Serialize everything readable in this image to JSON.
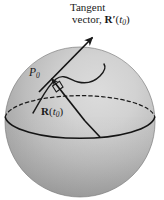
{
  "figure": {
    "width": 164,
    "height": 200,
    "background_color": "#ffffff"
  },
  "labels": {
    "tangent_line1": "Tangent",
    "tangent_line2_prefix": "vector, ",
    "tangent_vector_symbol": "R",
    "tangent_prime": "′",
    "tangent_arg_open": "(",
    "tangent_arg_var": "t",
    "tangent_arg_sub": "0",
    "tangent_arg_close": ")",
    "point_label_main": "P",
    "point_label_sub": "0",
    "position_vector_symbol": "R",
    "position_arg_open": "(",
    "position_arg_var": "t",
    "position_arg_sub": "0",
    "position_arg_close": ")"
  },
  "colors": {
    "sphere_highlight": "#d6d6d6",
    "sphere_mid": "#b8b8b8",
    "sphere_shadow": "#949494",
    "outline": "#1a1a1a",
    "text": "#1a1a1a",
    "background": "#ffffff"
  },
  "geometry": {
    "sphere_center_x": 80,
    "sphere_center_y": 122,
    "sphere_radius": 75,
    "equator_semi_major": 75,
    "equator_semi_minor": 23,
    "equator_center_y": 117,
    "point_p0_x": 50,
    "point_p0_y": 78,
    "tangent_arrow_tip_x": 93,
    "tangent_arrow_tip_y": 36,
    "position_vector_start_x": 84,
    "position_vector_start_y": 120
  },
  "elements": {
    "sphere_name": "sphere",
    "equator_back_name": "equator-back-dashed",
    "equator_front_name": "equator-front-solid",
    "curve_name": "surface-curve",
    "tangent_arrow_name": "tangent-vector-arrow",
    "position_arrow_name": "position-vector-arrow",
    "right_angle_name": "right-angle-marker",
    "point_dot_name": "point-p0-marker"
  }
}
